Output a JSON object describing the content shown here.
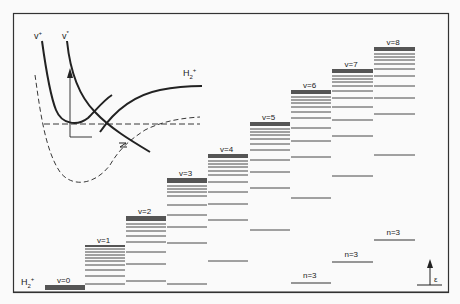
{
  "figure": {
    "title": "",
    "frame": {
      "x": 13,
      "y": 13,
      "w": 436,
      "h": 280
    },
    "inset_labels": {
      "curve_left": "v+",
      "curve_right": "v*",
      "ion_curve": "H2+"
    },
    "ion_label": "H2+",
    "energy_axis_label": "ε",
    "ladders": [
      {
        "label": "v=0",
        "x": 45,
        "w": 40,
        "band_top": 285,
        "band_bottom": 290,
        "lines": [],
        "label_y": 277
      },
      {
        "label": "v=1",
        "x": 85,
        "w": 40,
        "band_top": 245,
        "band_bottom": 247,
        "lines": [
          249,
          252,
          255,
          258,
          261,
          265,
          270,
          276,
          284
        ],
        "label_y": 237
      },
      {
        "label": "v=2",
        "x": 126,
        "w": 40,
        "band_top": 216,
        "band_bottom": 221,
        "lines": [
          224,
          227,
          231,
          236,
          242,
          252,
          264,
          281
        ],
        "label_y": 208
      },
      {
        "label": "v=3",
        "x": 167,
        "w": 40,
        "band_top": 178,
        "band_bottom": 183,
        "lines": [
          186,
          189,
          192,
          196,
          205,
          215,
          227,
          243,
          284
        ],
        "label_y": 170
      },
      {
        "label": "v=4",
        "x": 208,
        "w": 40,
        "band_top": 154,
        "band_bottom": 158,
        "lines": [
          161,
          164,
          167,
          171,
          175,
          182,
          192,
          204,
          220,
          261
        ],
        "label_y": 146
      },
      {
        "label": "v=5",
        "x": 250,
        "w": 40,
        "band_top": 122,
        "band_bottom": 126,
        "lines": [
          129,
          132,
          135,
          139,
          144,
          150,
          160,
          172,
          188,
          230
        ],
        "label_y": 114
      },
      {
        "label": "v=6",
        "x": 291,
        "w": 40,
        "band_top": 90,
        "band_bottom": 94,
        "lines": [
          97,
          100,
          103,
          107,
          112,
          118,
          128,
          141,
          157,
          198
        ],
        "label_y": 82
      },
      {
        "label": "v=7",
        "x": 332,
        "w": 41,
        "band_top": 69,
        "band_bottom": 73,
        "lines": [
          76,
          79,
          82,
          86,
          91,
          98,
          107,
          120,
          136,
          176
        ],
        "label_y": 61
      },
      {
        "label": "v=8",
        "x": 374,
        "w": 41,
        "band_top": 47,
        "band_bottom": 51,
        "lines": [
          54,
          57,
          60,
          64,
          69,
          76,
          86,
          98,
          114,
          155
        ],
        "label_y": 39
      }
    ],
    "n3_levels": [
      {
        "label": "n=3",
        "x": 291,
        "w": 40,
        "y": 283,
        "label_y": 272
      },
      {
        "label": "n=3",
        "x": 332,
        "w": 41,
        "y": 262,
        "label_y": 251
      },
      {
        "label": "n=3",
        "x": 374,
        "w": 41,
        "y": 240,
        "label_y": 229
      }
    ]
  }
}
